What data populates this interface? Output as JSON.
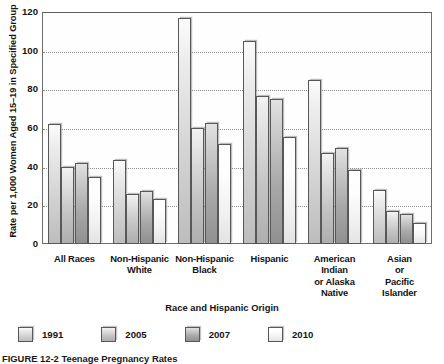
{
  "chart_data": {
    "type": "bar",
    "title": "",
    "xlabel": "Race and Hispanic Origin",
    "ylabel": "Rate per 1,000 Women Aged 15–19 in Specified Group",
    "ylim": [
      0,
      120
    ],
    "yticks": [
      0,
      20,
      40,
      60,
      80,
      100,
      120
    ],
    "grid": true,
    "legend_position": "bottom",
    "categories": [
      "All Races",
      "Non-Hispanic White",
      "Non-Hispanic Black",
      "Hispanic",
      "American Indian or Alaska Native",
      "Asian or Pacific Islander"
    ],
    "category_lines": [
      [
        "All Races"
      ],
      [
        "Non-Hispanic",
        "White"
      ],
      [
        "Non-Hispanic",
        "Black"
      ],
      [
        "Hispanic"
      ],
      [
        "American",
        "Indian",
        "or Alaska",
        "Native"
      ],
      [
        "Asian",
        "or",
        "Pacific",
        "Islander"
      ]
    ],
    "series": [
      {
        "name": "1991",
        "values": [
          62,
          43.5,
          117,
          105,
          85,
          28
        ]
      },
      {
        "name": "2005",
        "values": [
          40,
          26,
          60,
          76.5,
          47,
          17
        ]
      },
      {
        "name": "2007",
        "values": [
          42,
          27.5,
          62.5,
          75,
          49.5,
          15.5
        ]
      },
      {
        "name": "2010",
        "values": [
          34.5,
          23.5,
          51.5,
          55.5,
          38.5,
          11
        ]
      }
    ]
  },
  "caption": {
    "text": "FIGURE 12-2  Teenage Pregnancy Rates"
  }
}
